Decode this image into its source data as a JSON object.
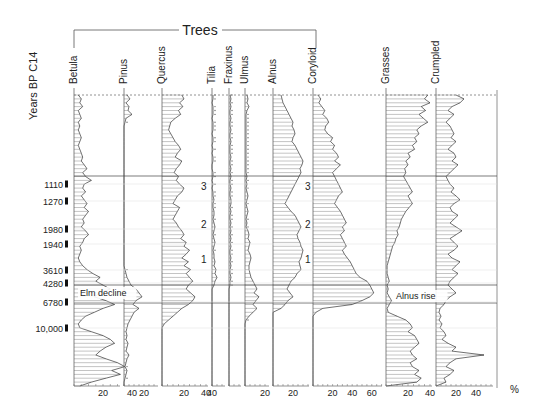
{
  "chart_data": {
    "type": "area",
    "title": "Trees",
    "ylabel": "Years BP C14",
    "xlabel": "%",
    "group_label": "Trees",
    "grid": false,
    "age_labels": [
      {
        "label": "1110",
        "y": 184
      },
      {
        "label": "1270",
        "y": 201
      },
      {
        "label": "1980",
        "y": 229
      },
      {
        "label": "1940",
        "y": 244
      },
      {
        "label": "3610",
        "y": 270
      },
      {
        "label": "4280",
        "y": 283
      },
      {
        "label": "6780",
        "y": 302
      },
      {
        "label": "10,000",
        "y": 328
      }
    ],
    "zone_lines": [
      176,
      285,
      303
    ],
    "annotations": [
      {
        "text": "Elm decline",
        "x": 80,
        "y": 296
      },
      {
        "text": "Alnus rise",
        "x": 396,
        "y": 299
      },
      {
        "text": "3",
        "x": 201,
        "y": 190
      },
      {
        "text": "2",
        "x": 201,
        "y": 228
      },
      {
        "text": "1",
        "x": 201,
        "y": 263
      },
      {
        "text": "3",
        "x": 305,
        "y": 190
      },
      {
        "text": "2",
        "x": 305,
        "y": 228
      },
      {
        "text": "1",
        "x": 305,
        "y": 263
      }
    ],
    "series": [
      {
        "name": "Betula",
        "x0": 74,
        "scale": 1.45,
        "ticks": [
          "20",
          "40"
        ],
        "tickvals": [
          20,
          40
        ],
        "width": 50,
        "values": [
          3,
          5,
          4,
          6,
          3,
          4,
          5,
          3,
          4,
          3,
          4,
          5,
          4,
          3,
          4,
          5,
          6,
          5,
          7,
          9,
          6,
          8,
          12,
          7,
          6,
          8,
          5,
          7,
          9,
          7,
          10,
          8,
          6,
          7,
          5,
          8,
          10,
          7,
          6,
          4,
          5,
          4,
          3,
          4,
          6,
          9,
          13,
          18,
          15,
          20,
          25,
          18,
          14,
          22,
          28,
          20,
          14,
          8,
          5,
          3,
          4,
          12,
          20,
          25,
          28,
          22,
          18,
          15,
          22,
          30,
          35,
          26,
          32,
          22,
          12,
          4
        ]
      },
      {
        "name": "Pinus",
        "x0": 124,
        "scale": 1.0,
        "ticks": [
          "20"
        ],
        "tickvals": [
          20
        ],
        "width": 38,
        "values": [
          3,
          6,
          2,
          5,
          4,
          8,
          2,
          1,
          0,
          0,
          0,
          0,
          0,
          0,
          0,
          0,
          0,
          0,
          0,
          0,
          0,
          0,
          0,
          0,
          0,
          0,
          0,
          0,
          0,
          0,
          0,
          0,
          0,
          0,
          0,
          0,
          0,
          0,
          0,
          0,
          0,
          0,
          0,
          0,
          0,
          1,
          2,
          3,
          5,
          7,
          12,
          15,
          18,
          12,
          9,
          15,
          10,
          8,
          6,
          4,
          3,
          2,
          3,
          2,
          4,
          3,
          2,
          5,
          3,
          2,
          1,
          3,
          2,
          1,
          0,
          0
        ]
      },
      {
        "name": "Quercus",
        "x0": 162,
        "scale": 1.1,
        "ticks": [
          "20",
          "40"
        ],
        "tickvals": [
          20,
          40
        ],
        "width": 50,
        "values": [
          18,
          20,
          16,
          19,
          15,
          17,
          12,
          8,
          7,
          6,
          8,
          10,
          12,
          15,
          17,
          14,
          12,
          18,
          16,
          13,
          11,
          15,
          13,
          16,
          20,
          18,
          14,
          12,
          10,
          16,
          14,
          12,
          10,
          13,
          15,
          18,
          20,
          17,
          22,
          20,
          25,
          22,
          18,
          24,
          20,
          26,
          22,
          25,
          28,
          24,
          22,
          26,
          30,
          28,
          24,
          18,
          14,
          10,
          6,
          2,
          0,
          0,
          0,
          0,
          0,
          0,
          0,
          0,
          0,
          0,
          0,
          0,
          0,
          0,
          0,
          0
        ]
      },
      {
        "name": "Tilia",
        "x0": 212,
        "scale": 1.0,
        "ticks": [
          "40"
        ],
        "tickvals": [
          0
        ],
        "width": 17,
        "values": [
          1,
          1,
          0,
          1,
          1,
          1,
          0,
          1,
          1,
          1,
          0,
          1,
          1,
          0,
          1,
          0,
          1,
          1,
          0,
          0,
          1,
          1,
          0,
          1,
          0,
          1,
          1,
          2,
          1,
          1,
          2,
          2,
          1,
          2,
          3,
          2,
          1,
          2,
          3,
          2,
          1,
          2,
          2,
          3,
          2,
          4,
          3,
          5,
          3,
          2,
          0,
          0,
          0,
          0,
          0,
          0,
          0,
          0,
          0,
          0,
          0,
          0,
          0,
          0,
          0,
          0,
          0,
          0,
          0,
          0,
          0,
          0,
          0,
          0,
          0,
          0
        ]
      },
      {
        "name": "Fraxinus",
        "x0": 229,
        "scale": 1.0,
        "ticks": [],
        "tickvals": [],
        "width": 16,
        "values": [
          1,
          2,
          1,
          2,
          1,
          1,
          2,
          1,
          1,
          2,
          1,
          1,
          2,
          1,
          1,
          1,
          2,
          1,
          1,
          2,
          1,
          2,
          1,
          1,
          2,
          1,
          1,
          2,
          2,
          1,
          2,
          1,
          1,
          2,
          1,
          2,
          1,
          2,
          1,
          2,
          1,
          1,
          2,
          1,
          2,
          1,
          1,
          2,
          1,
          1,
          0,
          0,
          0,
          0,
          0,
          0,
          0,
          0,
          0,
          0,
          0,
          0,
          0,
          0,
          0,
          0,
          0,
          0,
          0,
          0,
          0,
          0,
          0,
          0,
          0,
          0
        ]
      },
      {
        "name": "Ulmus",
        "x0": 245,
        "scale": 1.0,
        "ticks": [
          "20"
        ],
        "tickvals": [
          20
        ],
        "width": 28,
        "values": [
          2,
          3,
          2,
          4,
          2,
          1,
          1,
          1,
          1,
          1,
          1,
          1,
          1,
          1,
          1,
          1,
          1,
          1,
          1,
          1,
          1,
          2,
          1,
          2,
          1,
          2,
          3,
          2,
          1,
          2,
          3,
          2,
          1,
          2,
          1,
          3,
          4,
          3,
          5,
          4,
          3,
          5,
          6,
          5,
          4,
          4,
          5,
          6,
          8,
          10,
          12,
          9,
          14,
          11,
          8,
          12,
          8,
          4,
          1,
          0,
          0,
          0,
          0,
          0,
          0,
          0,
          0,
          0,
          0,
          0,
          0,
          0,
          0,
          0,
          0,
          0
        ]
      },
      {
        "name": "Alnus",
        "x0": 273,
        "scale": 1.0,
        "ticks": [
          "20"
        ],
        "tickvals": [
          20
        ],
        "width": 40,
        "values": [
          8,
          9,
          10,
          12,
          14,
          16,
          18,
          20,
          19,
          21,
          22,
          20,
          19,
          22,
          24,
          26,
          28,
          30,
          29,
          27,
          28,
          26,
          24,
          22,
          20,
          18,
          16,
          14,
          12,
          15,
          18,
          22,
          24,
          26,
          28,
          26,
          24,
          25,
          27,
          28,
          30,
          29,
          28,
          26,
          27,
          28,
          24,
          22,
          18,
          16,
          14,
          17,
          20,
          15,
          12,
          8,
          0,
          0,
          0,
          0,
          0,
          0,
          0,
          0,
          0,
          0,
          0,
          0,
          0,
          0,
          0,
          0,
          0,
          0,
          0,
          0
        ]
      },
      {
        "name": "Coryloid",
        "x0": 313,
        "scale": 0.98,
        "ticks": [
          "20",
          "40",
          "60"
        ],
        "tickvals": [
          20,
          40,
          60
        ],
        "width": 73,
        "values": [
          5,
          8,
          6,
          9,
          12,
          10,
          14,
          16,
          13,
          12,
          15,
          20,
          18,
          22,
          20,
          24,
          26,
          22,
          28,
          24,
          20,
          22,
          24,
          26,
          28,
          30,
          26,
          24,
          22,
          25,
          28,
          30,
          32,
          34,
          30,
          32,
          28,
          30,
          32,
          34,
          30,
          32,
          35,
          38,
          40,
          42,
          44,
          48,
          55,
          58,
          60,
          62,
          58,
          50,
          40,
          10,
          3,
          0,
          0,
          0,
          0,
          0,
          0,
          0,
          0,
          0,
          0,
          0,
          0,
          0,
          0,
          0,
          0,
          0,
          0,
          0
        ]
      },
      {
        "name": "Grasses",
        "x0": 386,
        "scale": 1.1,
        "ticks": [
          "20",
          "40"
        ],
        "tickvals": [
          20,
          40
        ],
        "width": 50,
        "values": [
          38,
          35,
          40,
          32,
          36,
          30,
          34,
          38,
          32,
          28,
          30,
          26,
          28,
          24,
          26,
          20,
          22,
          18,
          20,
          17,
          18,
          16,
          18,
          20,
          22,
          24,
          20,
          22,
          24,
          21,
          18,
          16,
          14,
          13,
          12,
          10,
          11,
          9,
          8,
          6,
          5,
          4,
          3,
          2,
          1,
          1,
          1,
          2,
          3,
          1,
          2,
          1,
          3,
          5,
          3,
          1,
          2,
          10,
          18,
          22,
          24,
          20,
          26,
          28,
          30,
          26,
          22,
          24,
          28,
          22,
          24,
          30,
          26,
          32,
          28,
          0
        ]
      },
      {
        "name": "Crumpled",
        "x0": 436,
        "scale": 1.0,
        "ticks": [
          "20",
          "40"
        ],
        "tickvals": [
          20,
          40
        ],
        "width": 61,
        "values": [
          20,
          28,
          24,
          16,
          12,
          18,
          14,
          10,
          14,
          16,
          18,
          15,
          20,
          16,
          12,
          18,
          20,
          16,
          22,
          18,
          14,
          10,
          12,
          14,
          18,
          15,
          20,
          24,
          18,
          14,
          16,
          22,
          18,
          14,
          20,
          26,
          20,
          14,
          18,
          22,
          18,
          12,
          16,
          24,
          20,
          16,
          22,
          18,
          14,
          12,
          16,
          20,
          14,
          10,
          8,
          4,
          3,
          5,
          3,
          6,
          4,
          8,
          10,
          6,
          12,
          20,
          16,
          48,
          20,
          14,
          10,
          18,
          14,
          8,
          10,
          0
        ]
      }
    ],
    "ylim_px": [
      95,
      386
    ],
    "axis_label": "%"
  }
}
